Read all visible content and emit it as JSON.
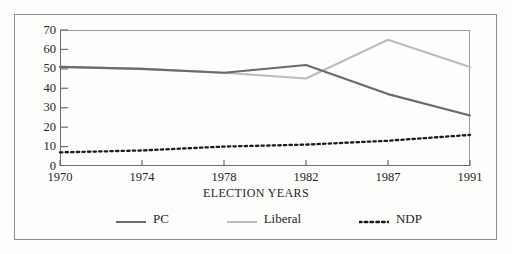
{
  "chart_data": {
    "type": "line",
    "title": "",
    "xlabel": "ELECTION YEARS",
    "ylabel": "",
    "categories": [
      "1970",
      "1974",
      "1978",
      "1982",
      "1987",
      "1991"
    ],
    "x": [
      1970,
      1974,
      1978,
      1982,
      1987,
      1991
    ],
    "ylim": [
      0,
      70
    ],
    "yticks": [
      0,
      10,
      20,
      30,
      40,
      50,
      60,
      70
    ],
    "grid": false,
    "legend_position": "bottom",
    "series": [
      {
        "name": "PC",
        "color": "#6b6b6b",
        "style": "solid",
        "values": [
          51,
          50,
          48,
          52,
          37,
          26
        ]
      },
      {
        "name": "Liberal",
        "color": "#bdbdbd",
        "style": "solid",
        "values": [
          51,
          50,
          48,
          45,
          65,
          51
        ]
      },
      {
        "name": "NDP",
        "color": "#1a1a1a",
        "style": "dotted",
        "values": [
          7,
          8,
          10,
          11,
          13,
          16
        ]
      }
    ]
  },
  "axes": {
    "y_tick_labels": [
      "70",
      "60",
      "50",
      "40",
      "30",
      "20",
      "10",
      "0"
    ],
    "x_tick_labels": [
      "1970",
      "1974",
      "1978",
      "1982",
      "1987",
      "1991"
    ],
    "x_axis_title": "ELECTION YEARS"
  },
  "legend": {
    "items": [
      {
        "label": "PC",
        "color": "#6b6b6b",
        "style": "solid"
      },
      {
        "label": "Liberal",
        "color": "#bdbdbd",
        "style": "solid"
      },
      {
        "label": "NDP",
        "color": "#1a1a1a",
        "style": "dotted"
      }
    ]
  },
  "colors": {
    "pc": "#6b6b6b",
    "liberal": "#bdbdbd",
    "ndp": "#1a1a1a",
    "axis": "#6e6e6e",
    "frame": "#8d8d8d",
    "background": "#fdfdfc"
  }
}
